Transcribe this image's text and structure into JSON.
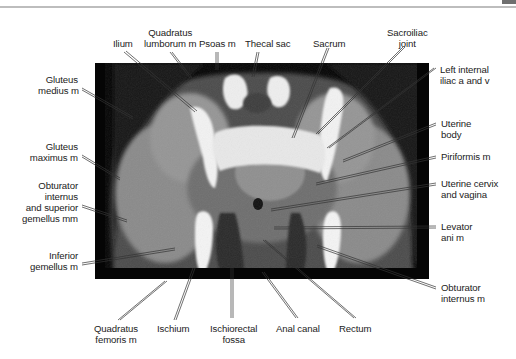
{
  "figure": {
    "type": "Axial CT of female pelvis with anatomical labels",
    "labels": {
      "ilium": "Ilium",
      "quadratus_lumborum": "Quadratus\nlumborum m",
      "psoas": "Psoas m",
      "thecal_sac": "Thecal sac",
      "sacrum": "Sacrum",
      "sacroiliac_joint": "Sacroiliac\njoint",
      "left_internal_iliac": "Left internal\niliac a and v",
      "gluteus_medius": "Gluteus\nmedius m",
      "gluteus_maximus": "Gluteus\nmaximus m",
      "obturator_internus_superior_gemellus": "Obturator\ninternus\nand superior\ngemellus mm",
      "inferior_gemellus": "Inferior\ngemellus m",
      "uterine_body": "Uterine\nbody",
      "piriformis": "Piriformis m",
      "uterine_cervix_vagina": "Uterine cervix\nand vagina",
      "levator_ani": "Levator\nani m",
      "obturator_internus": "Obturator\ninternus m",
      "quadratus_femoris": "Quadratus\nfemoris m",
      "ischium": "Ischium",
      "ischiorectal_fossa": "Ischiorectal\nfossa",
      "anal_canal": "Anal canal",
      "rectum": "Rectum"
    },
    "colors": {
      "background": "#ffffff",
      "text": "#222222",
      "leader_line": "#333333",
      "ct_frame": "#050505",
      "bone": "#f2f2f2",
      "soft_tissue": "#8a8a8a",
      "fat": "#3a3a3a"
    }
  }
}
